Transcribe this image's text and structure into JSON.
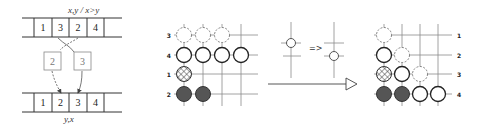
{
  "left_panel": {
    "top_label": "x,y / x>y",
    "bottom_label": "y,x",
    "top_cells": [
      "1",
      "3",
      "2",
      "4"
    ],
    "bottom_cells": [
      "1",
      "2",
      "3",
      "4"
    ],
    "floating_boxes": [
      "2",
      "3"
    ]
  },
  "grid_before": {
    "row_labels": [
      "3",
      "4",
      "1",
      "2"
    ],
    "stones": [
      {
        "row": 0,
        "col": 0,
        "style": "dashed"
      },
      {
        "row": 0,
        "col": 1,
        "style": "dashed"
      },
      {
        "row": 0,
        "col": 2,
        "style": "dashed"
      },
      {
        "row": 1,
        "col": 0,
        "style": "open"
      },
      {
        "row": 1,
        "col": 1,
        "style": "open"
      },
      {
        "row": 1,
        "col": 2,
        "style": "open"
      },
      {
        "row": 1,
        "col": 3,
        "style": "open"
      },
      {
        "row": 2,
        "col": 0,
        "style": "hatched"
      },
      {
        "row": 3,
        "col": 0,
        "style": "filled"
      },
      {
        "row": 3,
        "col": 1,
        "style": "filled"
      }
    ]
  },
  "transform_hint": {
    "arrow_text": "=>"
  },
  "grid_after": {
    "row_labels": [
      "1",
      "2",
      "3",
      "4"
    ],
    "stones": [
      {
        "row": 0,
        "col": 0,
        "style": "dashed"
      },
      {
        "row": 1,
        "col": 0,
        "style": "open"
      },
      {
        "row": 1,
        "col": 1,
        "style": "dashed"
      },
      {
        "row": 2,
        "col": 0,
        "style": "hatched"
      },
      {
        "row": 2,
        "col": 1,
        "style": "open"
      },
      {
        "row": 2,
        "col": 2,
        "style": "dashed"
      },
      {
        "row": 3,
        "col": 0,
        "style": "filled"
      },
      {
        "row": 3,
        "col": 1,
        "style": "filled"
      },
      {
        "row": 3,
        "col": 2,
        "style": "open"
      },
      {
        "row": 3,
        "col": 3,
        "style": "open"
      }
    ]
  },
  "colors": {
    "stone_fill_dark": "#555555",
    "line": "#8a8a8a",
    "stroke": "#333333"
  }
}
